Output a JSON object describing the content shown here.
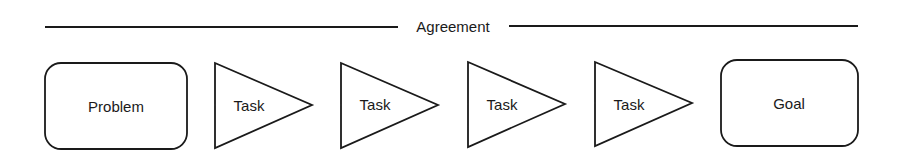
{
  "header": {
    "label": "Agreement"
  },
  "nodes": {
    "start": {
      "label": "Problem",
      "shape": "rounded-rectangle"
    },
    "tasks": [
      {
        "label": "Task",
        "shape": "triangle-right"
      },
      {
        "label": "Task",
        "shape": "triangle-right"
      },
      {
        "label": "Task",
        "shape": "triangle-right"
      },
      {
        "label": "Task",
        "shape": "triangle-right"
      }
    ],
    "end": {
      "label": "Goal",
      "shape": "rounded-rectangle"
    }
  },
  "colors": {
    "stroke": "#1a1a1a",
    "background": "#ffffff"
  }
}
